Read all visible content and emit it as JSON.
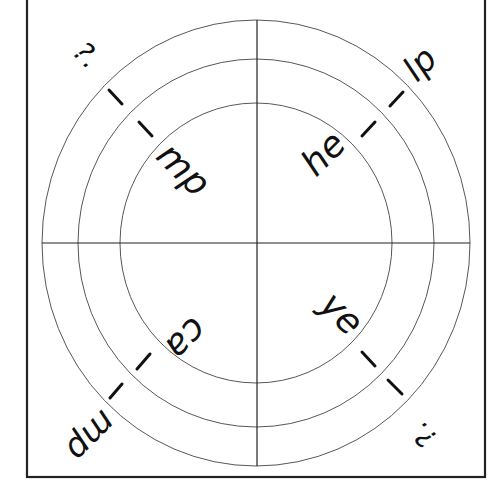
{
  "diagram": {
    "type": "sound-wheel",
    "colors": {
      "stroke": "#222222",
      "text": "#111111",
      "background": "#ffffff"
    },
    "quadrants": [
      {
        "position": "top-left",
        "inner": "mp",
        "dash1": "–",
        "dash2": "–",
        "outer": "?."
      },
      {
        "position": "top-right",
        "inner": "he",
        "dash1": "–",
        "dash2": "–",
        "outer": "lp"
      },
      {
        "position": "bottom-left",
        "inner": "ca",
        "dash1": "–",
        "dash2": "–",
        "outer": "mp"
      },
      {
        "position": "bottom-right",
        "inner": "ye",
        "dash1": "–",
        "dash2": "–",
        "outer": "?."
      }
    ]
  }
}
